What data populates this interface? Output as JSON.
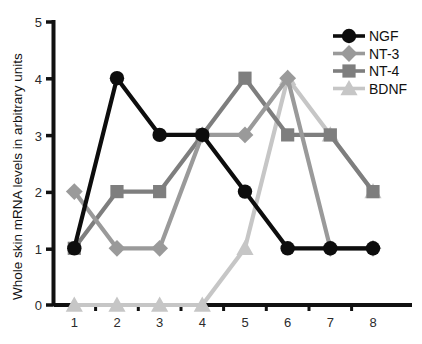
{
  "chart_data": {
    "type": "line",
    "title": "",
    "xlabel": "",
    "ylabel": "Whole skin mRNA levels in arbitrary units",
    "x": [
      1,
      2,
      3,
      4,
      5,
      6,
      7,
      8
    ],
    "xticklabels": [
      "1",
      "2",
      "3",
      "4",
      "5",
      "6",
      "7",
      "8"
    ],
    "yticklabels": [
      "0",
      "1",
      "2",
      "3",
      "4",
      "5"
    ],
    "xlim": [
      0.55,
      8.45
    ],
    "ylim": [
      0,
      5
    ],
    "grid": false,
    "legend_position": "top-right",
    "minor_xticks": true,
    "series": [
      {
        "name": "NGF",
        "values": [
          1,
          4,
          3,
          3,
          2,
          1,
          1,
          1
        ],
        "color": "#0d0d0d",
        "marker": "circle"
      },
      {
        "name": "NT-3",
        "values": [
          2,
          1,
          1,
          3,
          3,
          4,
          1,
          1
        ],
        "color": "#9a9a9a",
        "marker": "diamond"
      },
      {
        "name": "NT-4",
        "values": [
          1,
          2,
          2,
          3,
          4,
          3,
          3,
          2
        ],
        "color": "#7e7e7e",
        "marker": "square"
      },
      {
        "name": "BDNF",
        "values": [
          0,
          0,
          0,
          0,
          1,
          4,
          3,
          2
        ],
        "color": "#c6c6c6",
        "marker": "triangle"
      }
    ]
  },
  "legend": {
    "entries": [
      {
        "label": "NGF"
      },
      {
        "label": "NT-3"
      },
      {
        "label": "NT-4"
      },
      {
        "label": "BDNF"
      }
    ]
  },
  "axes": {
    "y_title": "Whole skin mRNA levels in arbitrary units",
    "axis_color": "#111111"
  }
}
